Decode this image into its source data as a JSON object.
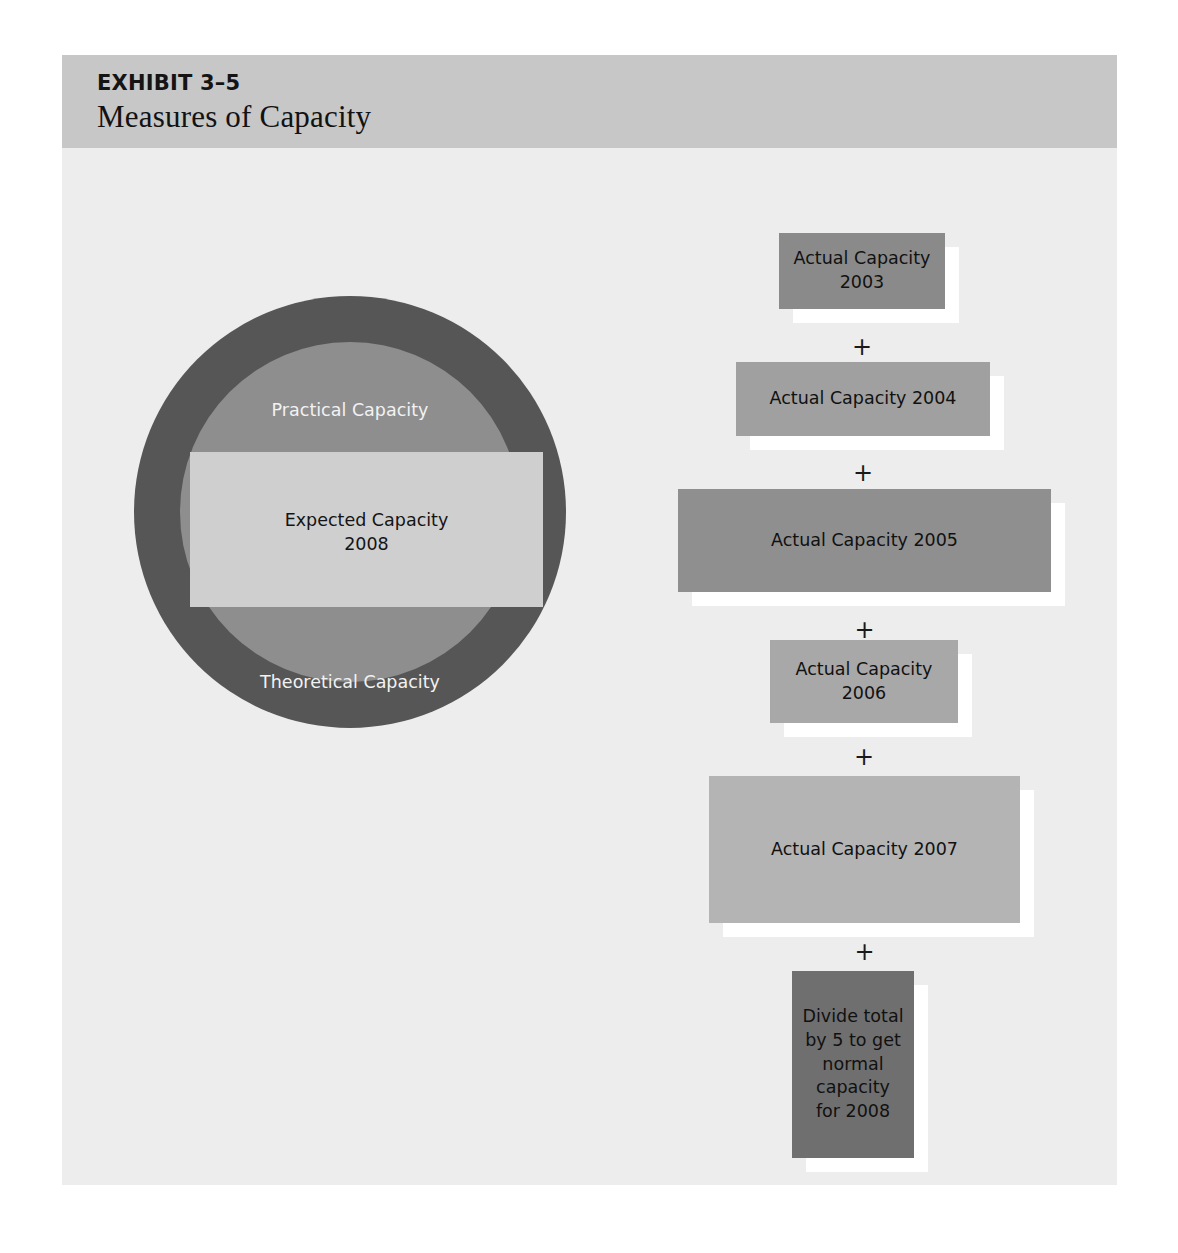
{
  "exhibit": {
    "number": "EXHIBIT 3–5",
    "title": "Measures of Capacity"
  },
  "circle_diagram": {
    "theoretical": {
      "label": "Theoretical Capacity",
      "color": "#565656"
    },
    "practical": {
      "label": "Practical Capacity",
      "color": "#8e8e8e"
    },
    "expected": {
      "label": "Expected Capacity\n2008",
      "line1": "Expected Capacity",
      "line2": "2008",
      "color": "#cfcfcf"
    }
  },
  "flow": {
    "operator": "+",
    "boxes": [
      {
        "id": "box-2003",
        "line1": "Actual Capacity",
        "line2": "2003",
        "color": "#8a8a8a"
      },
      {
        "id": "box-2004",
        "line1": "Actual Capacity 2004",
        "line2": "",
        "color": "#a0a0a0"
      },
      {
        "id": "box-2005",
        "line1": "Actual Capacity 2005",
        "line2": "",
        "color": "#8f8f8f"
      },
      {
        "id": "box-2006",
        "line1": "Actual Capacity",
        "line2": "2006",
        "color": "#a8a8a8"
      },
      {
        "id": "box-2007",
        "line1": "Actual Capacity 2007",
        "line2": "",
        "color": "#b4b4b4"
      },
      {
        "id": "box-divide",
        "line1": "Divide total by 5 to get normal capacity for 2008",
        "line2": "",
        "color": "#6f6f6f"
      }
    ],
    "divide_lines": [
      "Divide total",
      "by 5 to get",
      "normal",
      "capacity",
      "for 2008"
    ]
  },
  "chart_data": {
    "type": "diagram",
    "title": "Measures of Capacity",
    "subtitle": "EXHIBIT 3–5",
    "nested_circles": [
      {
        "name": "Theoretical Capacity",
        "level": 1,
        "shape": "circle",
        "fill": "#565656"
      },
      {
        "name": "Practical Capacity",
        "level": 2,
        "shape": "circle",
        "fill": "#8e8e8e"
      },
      {
        "name": "Expected Capacity 2008",
        "level": 3,
        "shape": "rectangle",
        "fill": "#cfcfcf"
      }
    ],
    "flow_sequence": [
      "Actual Capacity 2003",
      "+",
      "Actual Capacity 2004",
      "+",
      "Actual Capacity 2005",
      "+",
      "Actual Capacity 2006",
      "+",
      "Actual Capacity 2007",
      "+",
      "Divide total by 5 to get normal capacity for 2008"
    ],
    "note": "Box widths encode relative actual capacity per year; 2005 and 2007 are largest, 2003 smallest."
  }
}
